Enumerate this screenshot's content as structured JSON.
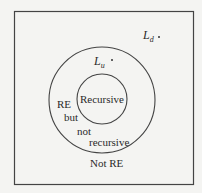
{
  "diagram": {
    "type": "venn-nested-sets",
    "regions": {
      "inner": "Recursive",
      "middle_line1": "RE",
      "middle_line2": "but",
      "middle_line3": "not",
      "middle_line4": "recursive",
      "outer": "Not RE"
    },
    "points": {
      "ld": {
        "main": "L",
        "sub": "d"
      },
      "lu": {
        "main": "L",
        "sub": "u"
      }
    },
    "colors": {
      "background": "#f4f4f2",
      "stroke": "#444444",
      "text": "#2a2a2a"
    }
  }
}
